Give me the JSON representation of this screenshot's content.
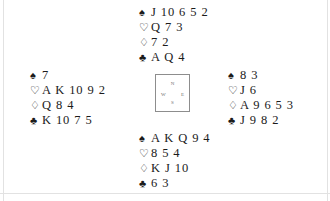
{
  "diagram": {
    "type": "bridge-deal-diagram",
    "suit_symbols": {
      "spades": "♠",
      "hearts": "♡",
      "diamonds": "♢",
      "clubs": "♣"
    },
    "compass": {
      "north": "N",
      "south": "S",
      "west": "W",
      "east": "E"
    },
    "hands": {
      "north": {
        "label": "North",
        "spades": "J 10 6 5 2",
        "hearts": "Q 7 3",
        "diamonds": "7 2",
        "clubs": "A Q 4"
      },
      "west": {
        "label": "West",
        "spades": "7",
        "hearts": "A K 10 9 2",
        "diamonds": "Q 8 4",
        "clubs": "K 10 7 5"
      },
      "east": {
        "label": "East",
        "spades": "8 3",
        "hearts": "J 6",
        "diamonds": "A 9 6 5 3",
        "clubs": "J 9 8 2"
      },
      "south": {
        "label": "South",
        "spades": "A K Q 9 4",
        "hearts": "8 5 4",
        "diamonds": "K J 10",
        "clubs": "6 3"
      }
    }
  }
}
